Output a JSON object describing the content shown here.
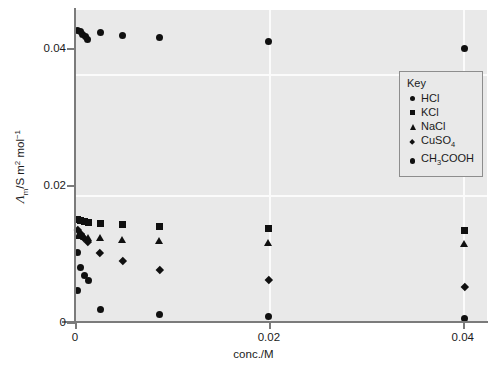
{
  "chart_data": {
    "type": "scatter",
    "title": "",
    "xlabel": "conc./M",
    "ylabel_html": "Λ_m/S m² mol⁻¹",
    "ylabel_symbol": "Λ",
    "ylabel_sub": "m",
    "ylabel_rest": "/S m",
    "ylabel_sup1": "2",
    "ylabel_unit": " mol",
    "ylabel_sup2": "−1",
    "xlim": [
      0,
      0.0425
    ],
    "ylim": [
      0,
      0.0455
    ],
    "xticks": [
      0,
      0.02,
      0.04
    ],
    "xticklabels": [
      "0",
      "0.02",
      "0.04"
    ],
    "yticks": [
      0,
      0.02,
      0.04
    ],
    "yticklabels": [
      "0",
      "0.02",
      "0.04"
    ],
    "grid": true,
    "grid_color": "#fbfbfb",
    "plot_bg": "#e9e9e9",
    "marker_color": "#101010",
    "legend_position": "upper right",
    "series": [
      {
        "name": "HCl",
        "marker": "circle",
        "points": [
          {
            "x": 0.0003,
            "y": 0.0425
          },
          {
            "x": 0.00055,
            "y": 0.0423
          },
          {
            "x": 0.0008,
            "y": 0.042
          },
          {
            "x": 0.0011,
            "y": 0.0416
          },
          {
            "x": 0.0013,
            "y": 0.0412
          },
          {
            "x": 0.0026,
            "y": 0.04215
          },
          {
            "x": 0.0049,
            "y": 0.04185
          },
          {
            "x": 0.0087,
            "y": 0.04155
          },
          {
            "x": 0.02,
            "y": 0.0409
          },
          {
            "x": 0.0402,
            "y": 0.0399
          }
        ]
      },
      {
        "name": "KCl",
        "marker": "square",
        "points": [
          {
            "x": 0.0003,
            "y": 0.0149
          },
          {
            "x": 0.0006,
            "y": 0.01475
          },
          {
            "x": 0.00095,
            "y": 0.01465
          },
          {
            "x": 0.00135,
            "y": 0.01455
          },
          {
            "x": 0.0026,
            "y": 0.0144
          },
          {
            "x": 0.0049,
            "y": 0.0142
          },
          {
            "x": 0.0087,
            "y": 0.014
          },
          {
            "x": 0.02,
            "y": 0.01365
          },
          {
            "x": 0.0402,
            "y": 0.0133
          }
        ]
      },
      {
        "name": "NaCl",
        "marker": "triangle",
        "points": [
          {
            "x": 0.0003,
            "y": 0.01255
          },
          {
            "x": 0.0006,
            "y": 0.01245
          },
          {
            "x": 0.00095,
            "y": 0.01235
          },
          {
            "x": 0.00135,
            "y": 0.01225
          },
          {
            "x": 0.0026,
            "y": 0.01215
          },
          {
            "x": 0.0049,
            "y": 0.012
          },
          {
            "x": 0.0087,
            "y": 0.01185
          },
          {
            "x": 0.02,
            "y": 0.01155
          },
          {
            "x": 0.0402,
            "y": 0.01135
          }
        ]
      },
      {
        "name": "CuSO4",
        "marker": "diamond",
        "points": [
          {
            "x": 0.0003,
            "y": 0.0135
          },
          {
            "x": 0.0006,
            "y": 0.0129
          },
          {
            "x": 0.00095,
            "y": 0.01225
          },
          {
            "x": 0.00135,
            "y": 0.0117
          },
          {
            "x": 0.0026,
            "y": 0.0101
          },
          {
            "x": 0.0049,
            "y": 0.00895
          },
          {
            "x": 0.0087,
            "y": 0.0076
          },
          {
            "x": 0.02,
            "y": 0.0062
          },
          {
            "x": 0.0402,
            "y": 0.0051
          }
        ]
      },
      {
        "name": "CH3COOH",
        "marker": "circle",
        "points": [
          {
            "x": 0.0003,
            "y": 0.0101
          },
          {
            "x": 0.0006,
            "y": 0.0079
          },
          {
            "x": 0.00095,
            "y": 0.0068
          },
          {
            "x": 0.00135,
            "y": 0.006
          },
          {
            "x": 0.0003,
            "y": 0.00455
          },
          {
            "x": 0.0026,
            "y": 0.00185
          },
          {
            "x": 0.0087,
            "y": 0.00115
          },
          {
            "x": 0.02,
            "y": 0.0008
          },
          {
            "x": 0.0402,
            "y": 0.00055
          }
        ]
      }
    ]
  },
  "legend": {
    "title": "Key",
    "items": [
      {
        "label": "HCl",
        "marker": "circle"
      },
      {
        "label": "KCl",
        "marker": "square"
      },
      {
        "label": "NaCl",
        "marker": "triangle"
      },
      {
        "label_pre": "CuSO",
        "label_sub": "4",
        "label_post": "",
        "marker": "diamond"
      },
      {
        "label_pre": "CH",
        "label_sub": "3",
        "label_post": "COOH",
        "marker": "circle"
      }
    ]
  },
  "axes": {
    "x_title": "conc./M",
    "x_ticklabels": [
      "0",
      "0.02",
      "0.04"
    ],
    "y_ticklabels": [
      "0",
      "0.02",
      "0.04"
    ]
  }
}
